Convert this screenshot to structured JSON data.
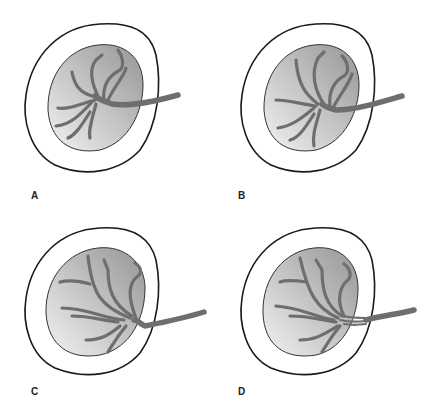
{
  "figure": {
    "panels": [
      {
        "id": "A",
        "label": "A",
        "description": "Cord inserted near center of placental disc, vessels branching"
      },
      {
        "id": "B",
        "label": "B",
        "description": "Eccentric cord insertion"
      },
      {
        "id": "C",
        "label": "C",
        "description": "Marginal cord insertion at placental edge"
      },
      {
        "id": "D",
        "label": "D",
        "description": "Velamentous insertion, vessels split before reaching disc"
      }
    ],
    "colors": {
      "outline": "#1a1a1a",
      "disc_light": "#eeeeee",
      "disc_dark": "#9a9a9a",
      "vessel": "#6e6e6e",
      "background": "#ffffff"
    }
  }
}
